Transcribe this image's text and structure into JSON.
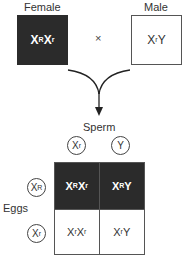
{
  "parents": {
    "female": {
      "label": "Female",
      "genotype_base1": "X",
      "genotype_sup1": "R",
      "genotype_base2": "X",
      "genotype_sup2": "r",
      "fill": "#2b2b2b"
    },
    "cross_symbol": "×",
    "male": {
      "label": "Male",
      "genotype_base1": "X",
      "genotype_sup1": "r",
      "genotype_base2": "Y",
      "fill": "#ffffff"
    }
  },
  "punnett": {
    "sperm_label": "Sperm",
    "eggs_label": "Eggs",
    "sperm": [
      {
        "base": "X",
        "sup": "r"
      },
      {
        "base": "Y",
        "sup": ""
      }
    ],
    "eggs": [
      {
        "base": "X",
        "sup": "R"
      },
      {
        "base": "X",
        "sup": "r"
      }
    ],
    "cells": [
      [
        {
          "b1": "X",
          "s1": "R",
          "b2": "X",
          "s2": "r"
        },
        {
          "b1": "X",
          "s1": "R",
          "b2": "Y",
          "s2": ""
        }
      ],
      [
        {
          "b1": "X",
          "s1": "r",
          "b2": "X",
          "s2": "r"
        },
        {
          "b1": "X",
          "s1": "r",
          "b2": "Y",
          "s2": ""
        }
      ]
    ],
    "dark_row_color": "#2b2b2b"
  }
}
